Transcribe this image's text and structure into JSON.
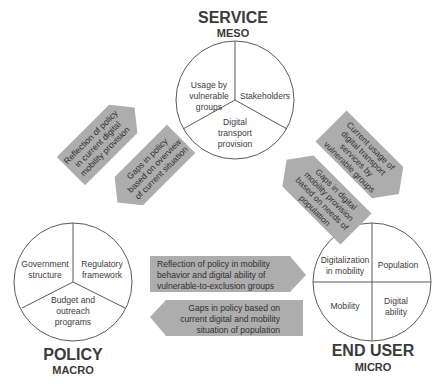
{
  "colors": {
    "arrow_fill": "#adadad",
    "circle_stroke": "#5a5a5a",
    "text": "#333333",
    "background": "#ffffff"
  },
  "nodes": {
    "service": {
      "title": "SERVICE",
      "subtitle": "MESO",
      "segments": [
        "Usage by vulnerable groups",
        "Stakeholders",
        "Digital transport provision"
      ],
      "lines": {
        "s0": [
          "Usage by",
          "vulnerable",
          "groups"
        ],
        "s1": [
          "Stakeholders"
        ],
        "s2": [
          "Digital",
          "transport",
          "provision"
        ]
      }
    },
    "policy": {
      "title": "POLICY",
      "subtitle": "MACRO",
      "segments": [
        "Government structure",
        "Regulatory framework",
        "Budget and outreach programs"
      ],
      "lines": {
        "s0": [
          "Government",
          "structure"
        ],
        "s1": [
          "Regulatory",
          "framework"
        ],
        "s2": [
          "Budget and",
          "outreach",
          "programs"
        ]
      }
    },
    "end_user": {
      "title": "END USER",
      "subtitle": "MICRO",
      "segments": [
        "Digitalization in mobility",
        "Population",
        "Mobility",
        "Digital ability"
      ],
      "lines": {
        "s0": [
          "Digitalization",
          "in mobility"
        ],
        "s1": [
          "Population"
        ],
        "s2": [
          "Mobility"
        ],
        "s3": [
          "Digital",
          "ability"
        ]
      }
    }
  },
  "arrows": {
    "policy_to_service": {
      "from": "Policy",
      "to": "Service",
      "text": "Reflection of policy in current digital mobility provision",
      "lines": [
        "Reflection of policy",
        "in current digital",
        "mobility provision"
      ]
    },
    "service_to_policy": {
      "from": "Service",
      "to": "Policy",
      "text": "Gaps in policy based on overview of current situation",
      "lines": [
        "Gaps in policy",
        "based on overview",
        "of current situation"
      ]
    },
    "service_to_enduser": {
      "from": "Service",
      "to": "End User",
      "text": "Current usage of digital transport services by vulnerable groups",
      "lines": [
        "Current usage of",
        "digital transport",
        "services by",
        "vulnerable groups"
      ]
    },
    "enduser_to_service": {
      "from": "End User",
      "to": "Service",
      "text": "Gaps in digital mobility provision based on needs of population",
      "lines": [
        "Gaps in digital",
        "mobility provision",
        "based on needs of",
        "population"
      ]
    },
    "policy_to_enduser": {
      "from": "Policy",
      "to": "End User",
      "text": "Reflection of policy in mobility behavior and digital ability of vulnerable-to-exclusion groups",
      "lines": [
        "Reflection of policy in mobility",
        "behavior and digital ability of",
        "vulnerable-to-exclusion groups"
      ]
    },
    "enduser_to_policy": {
      "from": "End User",
      "to": "Policy",
      "text": "Gaps in policy based on current digital and mobility situation of population",
      "lines": [
        "Gaps in policy based on",
        "current digital and mobility",
        "situation of population"
      ]
    }
  }
}
